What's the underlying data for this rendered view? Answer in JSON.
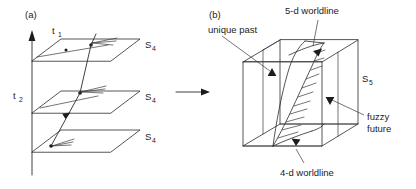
{
  "figure": {
    "title_visible": false,
    "background_color": "#ffffff",
    "ink_color": "#1c1c1c"
  },
  "panels": [
    {
      "id": "panel-a",
      "label": "(a)",
      "description": "Stack of three 4-dimensional spacelike hypersurfaces pierced by a single worldline, with a vertical time axis.",
      "axis": {
        "name": "time-axis",
        "orientation": "vertical",
        "arrow_at": "top"
      },
      "time_labels": [
        {
          "base": "t",
          "subscript": "1"
        },
        {
          "base": "t",
          "subscript": "2"
        }
      ],
      "surface_labels": [
        {
          "base": "S",
          "subscript": "4"
        },
        {
          "base": "S",
          "subscript": "4"
        },
        {
          "base": "S",
          "subscript": "4"
        }
      ],
      "planes_count": 3,
      "worldline_name": "4-d worldline"
    },
    {
      "id": "panel-b",
      "label": "(b)",
      "description": "A 5-dimensional box containing a 4-d worldline sheet spreading from a unique past into a fuzzy future.",
      "surface_label": {
        "base": "S",
        "subscript": "5"
      },
      "annotations": [
        {
          "id": "ann-5d-worldline",
          "text": "5-d worldline",
          "position": "top"
        },
        {
          "id": "ann-unique-past",
          "text": "unique past",
          "position": "left"
        },
        {
          "id": "ann-fuzzy-future",
          "text": "fuzzy future",
          "lines": [
            "fuzzy",
            "future"
          ],
          "position": "right"
        },
        {
          "id": "ann-4d-worldline",
          "text": "4-d worldline",
          "position": "bottom"
        }
      ]
    }
  ],
  "transition": {
    "name": "transition-arrow",
    "direction": "right",
    "label": ""
  }
}
